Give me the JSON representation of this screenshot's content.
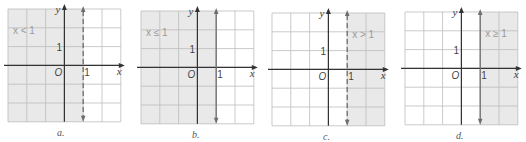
{
  "colors": {
    "shade": "#e9e9e9",
    "grid": "#bdbdbd",
    "axis": "#333333",
    "boundary": "#6e6e6e",
    "label_text": "#999999",
    "text": "#444444"
  },
  "common": {
    "x_axis_label": "x",
    "y_axis_label": "y",
    "origin_label": "O",
    "x_tick_label": "1",
    "y_tick_label": "1"
  },
  "graphs": [
    {
      "id": "a",
      "caption": "a.",
      "inequality": "x < 1",
      "boundary_style": "dashed",
      "shaded_side": "left",
      "offset_x": 8,
      "offset_y": 9,
      "cell": 18.8,
      "caption_x": 57,
      "caption_y": 127
    },
    {
      "id": "b",
      "caption": "b.",
      "inequality": "x ≤ 1",
      "boundary_style": "solid",
      "shaded_side": "left",
      "offset_x": 141,
      "offset_y": 11,
      "cell": 18.8,
      "caption_x": 192,
      "caption_y": 129
    },
    {
      "id": "c",
      "caption": "c.",
      "inequality": "x > 1",
      "boundary_style": "dashed",
      "shaded_side": "right",
      "offset_x": 272,
      "offset_y": 13,
      "cell": 18.8,
      "caption_x": 323,
      "caption_y": 131
    },
    {
      "id": "d",
      "caption": "d.",
      "inequality": "x ≥ 1",
      "boundary_style": "solid",
      "shaded_side": "right",
      "offset_x": 405,
      "offset_y": 12,
      "cell": 18.8,
      "caption_x": 456,
      "caption_y": 130
    }
  ]
}
